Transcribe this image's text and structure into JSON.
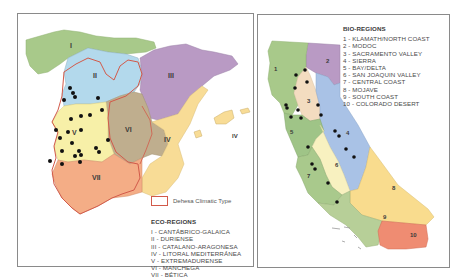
{
  "spain_map": {
    "region_labels": [
      "I",
      "II",
      "III",
      "IV",
      "IV",
      "V",
      "VI",
      "VII"
    ],
    "climatic_key_label": "Dehesa Climatic Type",
    "legend_title": "ECO-REGIONS",
    "legend_items": [
      "I - CANTÁBRICO-GALAICA",
      "II - DURIENSE",
      "III - CATALANO-ARAGONESA",
      "IV - LITORAL MEDITERRÁNEA",
      "V - EXTREMADURENSE",
      "VI - MANCHEGA",
      "VII - BÉTICA"
    ],
    "colors": {
      "I": "#a8c98a",
      "II": "#b3d9ec",
      "III": "#b99ac4",
      "IV": "#f8dc96",
      "V": "#f7f0a8",
      "VI": "#bfae8e",
      "VII": "#f4ad86",
      "dehesa_outline": "#d25a4a",
      "site_dot": "#111111"
    },
    "site_count": 23
  },
  "california_map": {
    "region_labels": [
      "1",
      "2",
      "3",
      "4",
      "5",
      "6",
      "7",
      "8",
      "9",
      "10"
    ],
    "legend_title": "BIO-REGIONS",
    "legend_items": [
      "1 - KLAMATH/NORTH COAST",
      "2 - MODOC",
      "3 - SACRAMENTO VALLEY",
      "4 - SIERRA",
      "5 - BAY/DELTA",
      "6 - SAN JOAQUIN VALLEY",
      "7 - CENTRAL COAST",
      "8 - MOJAVE",
      "9 - SOUTH COAST",
      "10 - COLORADO DESERT"
    ],
    "colors": {
      "1": "#a8c98a",
      "2": "#b99ac4",
      "3": "#f3dcc0",
      "4": "#a9c2e6",
      "5": "#9fc487",
      "6": "#f8f1c0",
      "7": "#a9c98c",
      "8": "#f9dc8e",
      "9": "#b7cf98",
      "10": "#ef8c72",
      "site_dot": "#111111"
    },
    "site_count": 20
  }
}
